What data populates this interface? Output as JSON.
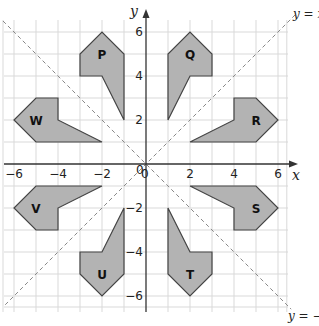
{
  "diagram": {
    "type": "coordinate-grid-reflections",
    "axes": {
      "x_label": "x",
      "y_label": "y",
      "x_ticks": [
        {
          "value": -6,
          "label": "−6"
        },
        {
          "value": -4,
          "label": "−4"
        },
        {
          "value": -2,
          "label": "−2"
        },
        {
          "value": 2,
          "label": "2"
        },
        {
          "value": 4,
          "label": "4"
        },
        {
          "value": 6,
          "label": "6"
        }
      ],
      "y_ticks": [
        {
          "value": 6,
          "label": "6"
        },
        {
          "value": 4,
          "label": "4"
        },
        {
          "value": 2,
          "label": "2"
        },
        {
          "value": -2,
          "label": "−2"
        },
        {
          "value": -4,
          "label": "−4"
        },
        {
          "value": -6,
          "label": "−6"
        }
      ],
      "origin_label": "0",
      "origin_label_alt": "0"
    },
    "lines": [
      {
        "id": "y-equals-x",
        "label_prefix": "y = ",
        "label_var": "x",
        "label": "y = x"
      },
      {
        "id": "y-equals-neg-x",
        "label_prefix": "y = −",
        "label_var": "x",
        "label": "y = −x"
      }
    ],
    "shapes": [
      {
        "name": "P",
        "vertices": [
          [
            -1,
            2
          ],
          [
            -1,
            5
          ],
          [
            -2,
            6
          ],
          [
            -3,
            5
          ],
          [
            -3,
            4
          ],
          [
            -2,
            4
          ]
        ],
        "label_pos": [
          -2,
          5
        ]
      },
      {
        "name": "Q",
        "vertices": [
          [
            1,
            2
          ],
          [
            1,
            5
          ],
          [
            2,
            6
          ],
          [
            3,
            5
          ],
          [
            3,
            4
          ],
          [
            2,
            4
          ]
        ],
        "label_pos": [
          2,
          5
        ]
      },
      {
        "name": "R",
        "vertices": [
          [
            2,
            1
          ],
          [
            5,
            1
          ],
          [
            6,
            2
          ],
          [
            5,
            3
          ],
          [
            4,
            3
          ],
          [
            4,
            2
          ]
        ],
        "label_pos": [
          5,
          2
        ]
      },
      {
        "name": "S",
        "vertices": [
          [
            2,
            -1
          ],
          [
            5,
            -1
          ],
          [
            6,
            -2
          ],
          [
            5,
            -3
          ],
          [
            4,
            -3
          ],
          [
            4,
            -2
          ]
        ],
        "label_pos": [
          5,
          -2
        ]
      },
      {
        "name": "T",
        "vertices": [
          [
            1,
            -2
          ],
          [
            1,
            -5
          ],
          [
            2,
            -6
          ],
          [
            3,
            -5
          ],
          [
            3,
            -4
          ],
          [
            2,
            -4
          ]
        ],
        "label_pos": [
          2,
          -5
        ]
      },
      {
        "name": "U",
        "vertices": [
          [
            -1,
            -2
          ],
          [
            -1,
            -5
          ],
          [
            -2,
            -6
          ],
          [
            -3,
            -5
          ],
          [
            -3,
            -4
          ],
          [
            -2,
            -4
          ]
        ],
        "label_pos": [
          -2,
          -5
        ]
      },
      {
        "name": "V",
        "vertices": [
          [
            -2,
            -1
          ],
          [
            -5,
            -1
          ],
          [
            -6,
            -2
          ],
          [
            -5,
            -3
          ],
          [
            -4,
            -3
          ],
          [
            -4,
            -2
          ]
        ],
        "label_pos": [
          -5,
          -2
        ]
      },
      {
        "name": "W",
        "vertices": [
          [
            -2,
            1
          ],
          [
            -5,
            1
          ],
          [
            -6,
            2
          ],
          [
            -5,
            3
          ],
          [
            -4,
            3
          ],
          [
            -4,
            2
          ]
        ],
        "label_pos": [
          -5,
          2
        ]
      }
    ],
    "colors": {
      "shape_fill": "#b3b3b3",
      "shape_stroke": "#444444",
      "grid": "#d9d9d9",
      "dashed_line": "#888888"
    }
  }
}
